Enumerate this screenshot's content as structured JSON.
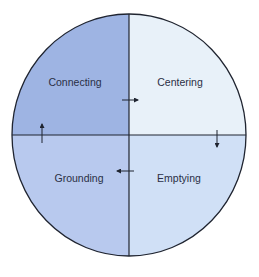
{
  "diagram": {
    "type": "quadrant-cycle",
    "quadrants": [
      {
        "id": "top-left",
        "label": "Connecting",
        "color": "#9eb4e3"
      },
      {
        "id": "top-right",
        "label": "Centering",
        "color": "#e8f1f9"
      },
      {
        "id": "bottom-right",
        "label": "Emptying",
        "color": "#d0e0f6"
      },
      {
        "id": "bottom-left",
        "label": "Grounding",
        "color": "#b8c9ee"
      }
    ],
    "arrows": [
      {
        "from": "Connecting",
        "to": "Centering",
        "direction": "right"
      },
      {
        "from": "Centering",
        "to": "Emptying",
        "direction": "down"
      },
      {
        "from": "Emptying",
        "to": "Grounding",
        "direction": "left"
      },
      {
        "from": "Grounding",
        "to": "Connecting",
        "direction": "up"
      }
    ],
    "stroke_color": "#1f2430"
  }
}
